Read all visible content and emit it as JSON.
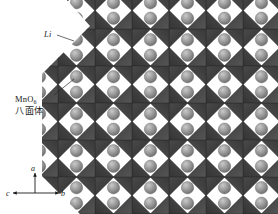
{
  "figure": {
    "background_color": "#ffffff"
  },
  "annotations": {
    "li": {
      "label": "Li",
      "leader_from": [
        57,
        35
      ],
      "leader_to": [
        74,
        41
      ]
    },
    "mno6": {
      "label_main": "MnO",
      "label_subscript": "6",
      "label_cn": "八面体",
      "leader_from": [
        54,
        95
      ],
      "leader_to": [
        72,
        80
      ]
    }
  },
  "axes": {
    "a": "a",
    "b": "b",
    "c": "c"
  },
  "colors": {
    "octahedron_dark": "#3b3b3b",
    "octahedron_mid": "#474747",
    "octahedron_light": "#555555",
    "octahedron_edge": "#2a2a2a",
    "li_sphere": "#9b9b9b",
    "li_sphere_highlight": "#c4c4c4",
    "li_sphere_shadow": "#6e6e6e",
    "void_white": "#fbfbfb",
    "text": "#1a1a1a"
  },
  "chart_data": {
    "type": "diagram",
    "lattice": {
      "cell_width": 37,
      "cell_height": 37,
      "origin_x": 58,
      "origin_y": -8,
      "columns": 7,
      "rows": 7,
      "clip_left_diagonal": true
    },
    "species": [
      {
        "name": "Li",
        "shape": "sphere",
        "color": "#9b9b9b",
        "radius": 6.2
      },
      {
        "name": "MnO6 octahedron",
        "shape": "diamond",
        "color": "#3b3b3b"
      }
    ],
    "axis_triad": {
      "up": "a",
      "right": "b",
      "left": "c"
    }
  }
}
